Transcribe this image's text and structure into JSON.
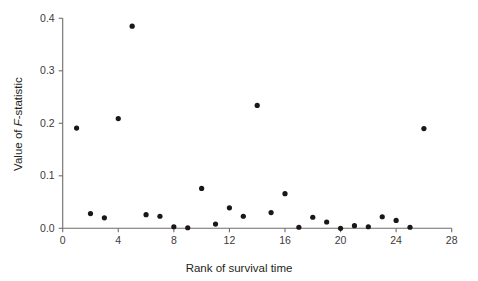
{
  "chart_data": {
    "type": "scatter",
    "title": "",
    "xlabel": "Rank of survival time",
    "ylabel": "Value of F-statistic",
    "ylabel_parts": {
      "prefix": "Value of ",
      "italic": "F",
      "suffix": "-statistic"
    },
    "xlim": [
      0,
      28
    ],
    "ylim": [
      0.0,
      0.4
    ],
    "xticks": [
      0,
      4,
      8,
      12,
      16,
      20,
      24,
      28
    ],
    "xticklabels": [
      "0",
      "4",
      "8",
      "12",
      "16",
      "20",
      "24",
      "28"
    ],
    "yticks": [
      0.0,
      0.1,
      0.2,
      0.3,
      0.4
    ],
    "yticklabels": [
      "0.0",
      "0.1",
      "0.2",
      "0.3",
      "0.4"
    ],
    "grid": false,
    "legend": null,
    "marker": "filled-circle",
    "marker_color": "#1a1718",
    "x": [
      1,
      2,
      3,
      4,
      5,
      6,
      7,
      8,
      9,
      10,
      11,
      12,
      13,
      14,
      15,
      16,
      17,
      18,
      19,
      20,
      21,
      22,
      23,
      24,
      25,
      26
    ],
    "y": [
      0.191,
      0.028,
      0.02,
      0.209,
      0.385,
      0.026,
      0.023,
      0.003,
      0.001,
      0.076,
      0.008,
      0.039,
      0.023,
      0.234,
      0.03,
      0.066,
      0.002,
      0.021,
      0.012,
      0.0,
      0.005,
      0.003,
      0.022,
      0.015,
      0.002,
      0.19
    ],
    "points": [
      {
        "rank": 1,
        "value": 0.191
      },
      {
        "rank": 2,
        "value": 0.028
      },
      {
        "rank": 3,
        "value": 0.02
      },
      {
        "rank": 4,
        "value": 0.209
      },
      {
        "rank": 5,
        "value": 0.385
      },
      {
        "rank": 6,
        "value": 0.026
      },
      {
        "rank": 7,
        "value": 0.023
      },
      {
        "rank": 8,
        "value": 0.003
      },
      {
        "rank": 9,
        "value": 0.001
      },
      {
        "rank": 10,
        "value": 0.076
      },
      {
        "rank": 11,
        "value": 0.008
      },
      {
        "rank": 12,
        "value": 0.039
      },
      {
        "rank": 13,
        "value": 0.023
      },
      {
        "rank": 14,
        "value": 0.234
      },
      {
        "rank": 15,
        "value": 0.03
      },
      {
        "rank": 16,
        "value": 0.066
      },
      {
        "rank": 17,
        "value": 0.002
      },
      {
        "rank": 18,
        "value": 0.021
      },
      {
        "rank": 19,
        "value": 0.012
      },
      {
        "rank": 20,
        "value": 0.0
      },
      {
        "rank": 21,
        "value": 0.005
      },
      {
        "rank": 22,
        "value": 0.003
      },
      {
        "rank": 23,
        "value": 0.022
      },
      {
        "rank": 24,
        "value": 0.015
      },
      {
        "rank": 25,
        "value": 0.002
      },
      {
        "rank": 26,
        "value": 0.19
      }
    ]
  },
  "colors": {
    "background": "#ffffff",
    "axis": "#6f6d6e",
    "marker": "#1a1718",
    "text": "#231f20"
  }
}
